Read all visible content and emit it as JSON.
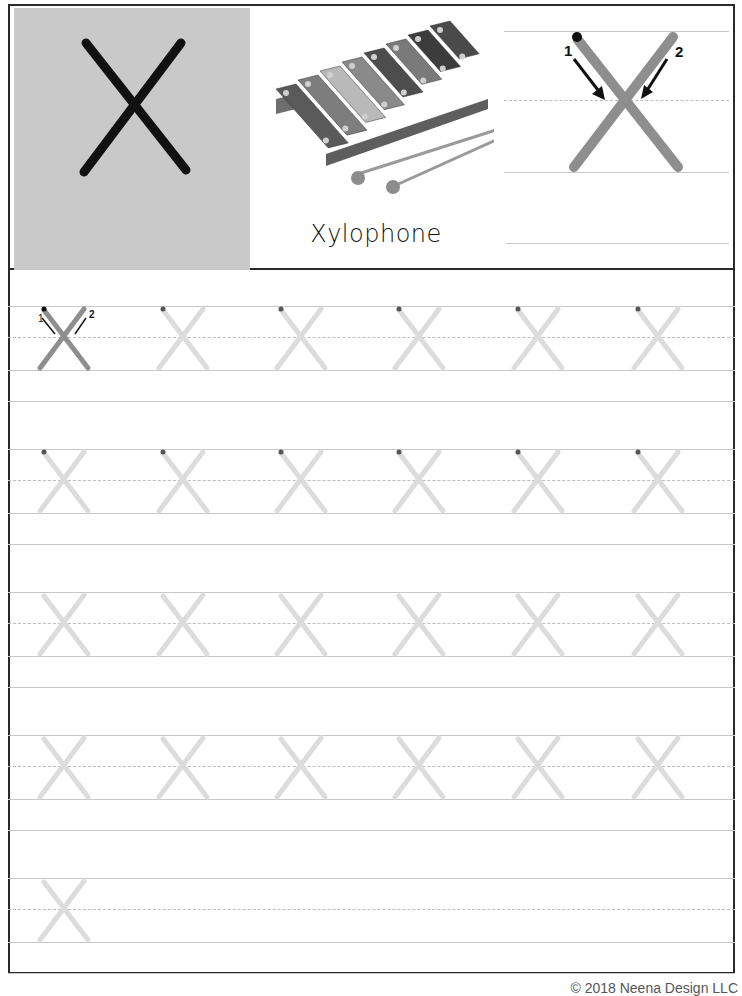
{
  "header": {
    "letter": "X",
    "picture": {
      "icon": "xylophone-icon",
      "word": "Xylophone",
      "bar_colors": [
        "#5a5a5a",
        "#7d7d7d",
        "#b9b9b9",
        "#8a8a8a",
        "#4d4d4d",
        "#7a7a7a",
        "#3c3c3c",
        "#4a4a4a"
      ],
      "mallet_color": "#9a9a9a"
    },
    "stroke_demo": {
      "stroke_1_label": "1",
      "stroke_2_label": "2",
      "letter_color": "#8e8e8e",
      "start_dot_color": "#111111"
    }
  },
  "practice": {
    "rows": [
      {
        "id": "row-1",
        "letters": 6,
        "first_is_guided": true,
        "has_start_dots": true
      },
      {
        "id": "row-2",
        "letters": 6,
        "first_is_guided": false,
        "has_start_dots": true
      },
      {
        "id": "row-3",
        "letters": 6,
        "first_is_guided": false,
        "has_start_dots": false
      },
      {
        "id": "row-4",
        "letters": 6,
        "first_is_guided": false,
        "has_start_dots": false
      },
      {
        "id": "row-5",
        "letters": 1,
        "first_is_guided": false,
        "has_start_dots": false
      }
    ],
    "guided_labels": {
      "stroke_1": "1",
      "stroke_2": "2"
    },
    "trace_color": "#dcdcdc",
    "guided_color": "#8e8e8e",
    "dot_color": "#555555"
  },
  "footer": {
    "copyright": "© 2018 Neena Design LLC"
  }
}
